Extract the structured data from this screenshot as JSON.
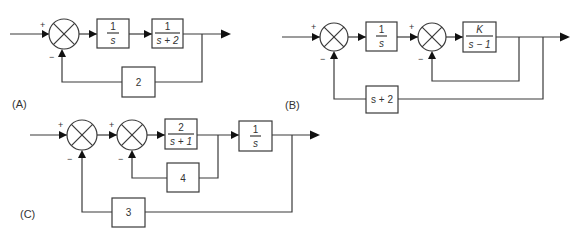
{
  "diagrams": {
    "A": {
      "label": "(A)",
      "summer": {
        "plus": "+",
        "minus": "−"
      },
      "forward": [
        {
          "num": "1",
          "den": "s"
        },
        {
          "num": "1",
          "den": "s + 2"
        }
      ],
      "feedback": {
        "text": "2"
      }
    },
    "B": {
      "label": "(B)",
      "summer1": {
        "plus": "+",
        "minus": "−"
      },
      "summer2": {
        "plus": "+",
        "minus": "−"
      },
      "forward": [
        {
          "num": "1",
          "den": "s"
        },
        {
          "num": "K",
          "den": "s − 1"
        }
      ],
      "feedback": {
        "text": "s + 2"
      }
    },
    "C": {
      "label": "(C)",
      "summer1": {
        "plus": "+",
        "minus": "−"
      },
      "summer2": {
        "plus": "+",
        "minus": "−"
      },
      "forward": [
        {
          "num": "2",
          "den": "s + 1"
        },
        {
          "num": "1",
          "den": "s"
        }
      ],
      "inner_feedback": {
        "text": "4"
      },
      "outer_feedback": {
        "text": "3"
      }
    }
  },
  "colors": {
    "line": "#3a3a3a",
    "arrow": "#111111",
    "text": "#333333",
    "background": "#ffffff"
  }
}
